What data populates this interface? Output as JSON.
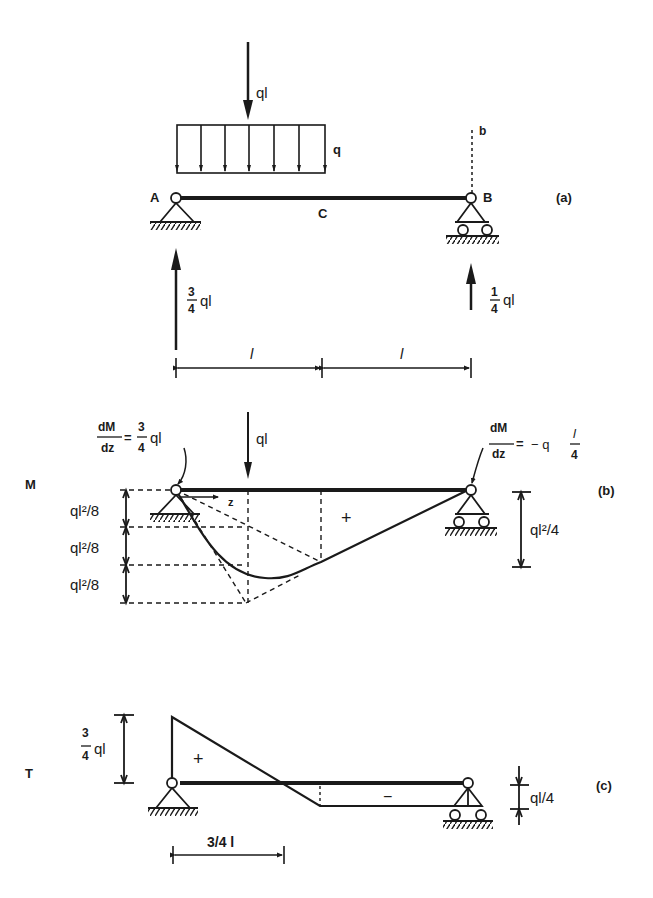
{
  "figure": {
    "part_a": {
      "tag": "(a)",
      "point_load_label": "ql",
      "distributed_load_label": "q",
      "support_a_label": "A",
      "support_b_label": "B",
      "midpoint_label": "C",
      "section_label": "b",
      "reaction_a": {
        "num": "3",
        "den": "4",
        "suffix": "ql"
      },
      "reaction_b": {
        "num": "1",
        "den": "4",
        "suffix": "ql"
      },
      "span_left": "l",
      "span_right": "l"
    },
    "part_b": {
      "tag": "(b)",
      "diagram_label": "M",
      "slope_a": {
        "lhs_num": "dM",
        "lhs_den": "dz",
        "eq": "=",
        "num": "3",
        "den": "4",
        "suffix": "ql"
      },
      "slope_b": {
        "lhs_num": "dM",
        "lhs_den": "dz",
        "eq": "=",
        "prefix": "− q",
        "num": "l",
        "den": "4"
      },
      "point_load_label": "ql",
      "axis_label": "z",
      "sign": "+",
      "dim_steps": [
        "ql²/8",
        "ql²/8",
        "ql²/8"
      ],
      "dim_right": "ql²/4"
    },
    "part_c": {
      "tag": "(c)",
      "diagram_label": "T",
      "left_value": {
        "num": "3",
        "den": "4",
        "suffix": "ql"
      },
      "positive_sign": "+",
      "negative_sign": "−",
      "right_value": "ql/4",
      "zero_dim": "3/4 l"
    }
  }
}
